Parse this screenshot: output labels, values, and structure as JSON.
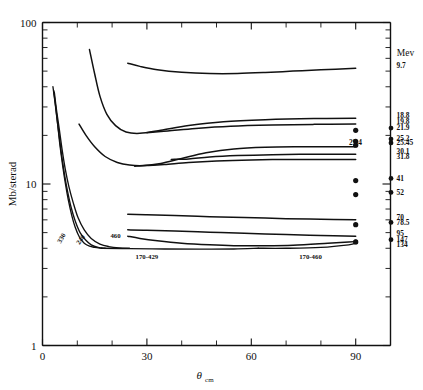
{
  "figure": {
    "name": "differential-cross-section-vs-angle",
    "background": "#ffffff",
    "ink_color": "#111111"
  },
  "chart_data": {
    "type": "line",
    "title": "",
    "xlabel": "θ",
    "xlabel_sub": "cm",
    "ylabel": "Mb/sterad",
    "legend_title": "Mev",
    "legend_position": "right-outside",
    "grid": false,
    "xlim": [
      0,
      100
    ],
    "ylim": [
      1,
      100
    ],
    "yscale": "log",
    "xscale": "linear",
    "x_ticks_major": [
      0,
      30,
      60,
      90
    ],
    "x_tick_labels": [
      "0",
      "30",
      "60",
      "90"
    ],
    "x_ticks_minor": [
      10,
      20,
      40,
      50,
      70,
      80,
      100
    ],
    "y_ticks_major": [
      1,
      10,
      100
    ],
    "y_tick_labels": [
      "1",
      "10",
      "100"
    ],
    "y_ticks_minor": [
      2,
      3,
      4,
      5,
      6,
      7,
      8,
      9,
      20,
      30,
      40,
      50,
      60,
      70,
      80,
      90
    ],
    "series": [
      {
        "name": "9.7",
        "legend_label": "9.7",
        "kind": "curve",
        "end_y": 52,
        "points": [
          [
            24.5,
            56.0
          ],
          [
            28.0,
            53.5
          ],
          [
            33.0,
            51.0
          ],
          [
            40.0,
            49.2
          ],
          [
            48.0,
            48.3
          ],
          [
            56.0,
            48.3
          ],
          [
            64.0,
            49.0
          ],
          [
            72.0,
            50.0
          ],
          [
            80.0,
            51.0
          ],
          [
            90.0,
            52.0
          ]
        ]
      },
      {
        "name": "18.8",
        "legend_label": "18.8",
        "kind": "curve",
        "end_y": 25.5,
        "points": [
          [
            13.5,
            68.0
          ],
          [
            15.0,
            48.0
          ],
          [
            16.5,
            35.0
          ],
          [
            18.5,
            27.0
          ],
          [
            21.0,
            23.0
          ],
          [
            24.0,
            21.0
          ],
          [
            28.0,
            20.6
          ],
          [
            34.0,
            21.5
          ],
          [
            42.0,
            23.0
          ],
          [
            52.0,
            24.3
          ],
          [
            64.0,
            25.0
          ],
          [
            78.0,
            25.4
          ],
          [
            90.0,
            25.5
          ]
        ]
      },
      {
        "name": "19.8",
        "legend_label": "19.8",
        "kind": "curve",
        "end_y": 23.5,
        "points": [
          [
            30.0,
            20.8
          ],
          [
            36.0,
            21.3
          ],
          [
            44.0,
            22.1
          ],
          [
            54.0,
            22.8
          ],
          [
            66.0,
            23.2
          ],
          [
            78.0,
            23.4
          ],
          [
            90.0,
            23.5
          ]
        ]
      },
      {
        "name": "21.9",
        "legend_label": "21.9",
        "kind": "point",
        "point": [
          90.0,
          21.5
        ]
      },
      {
        "name": "25.2",
        "legend_label": "25.2",
        "kind": "point",
        "point": [
          90.0,
          18.4
        ]
      },
      {
        "name": "25.45",
        "legend_label": "25.45",
        "kind": "point",
        "point": [
          90.0,
          17.4
        ]
      },
      {
        "name": "29.4",
        "legend_label": "29.4",
        "kind": "curve",
        "end_y": 17.0,
        "points": [
          [
            10.5,
            23.5
          ],
          [
            12.5,
            20.0
          ],
          [
            15.0,
            17.0
          ],
          [
            18.0,
            14.8
          ],
          [
            21.5,
            13.6
          ],
          [
            25.0,
            13.1
          ],
          [
            29.0,
            13.0
          ],
          [
            34.0,
            13.4
          ],
          [
            40.0,
            14.4
          ],
          [
            47.0,
            15.6
          ],
          [
            55.0,
            16.5
          ],
          [
            64.0,
            16.9
          ],
          [
            74.0,
            17.0
          ],
          [
            84.0,
            17.0
          ],
          [
            90.0,
            17.0
          ]
        ]
      },
      {
        "name": "30.1",
        "legend_label": "30.1",
        "kind": "curve",
        "end_y": 15.3,
        "points": [
          [
            37.0,
            14.2
          ],
          [
            42.0,
            14.3
          ],
          [
            48.0,
            14.7
          ],
          [
            56.0,
            15.0
          ],
          [
            66.0,
            15.2
          ],
          [
            78.0,
            15.3
          ],
          [
            90.0,
            15.3
          ]
        ]
      },
      {
        "name": "31.8",
        "legend_label": "31.8",
        "kind": "curve",
        "end_y": 14.2,
        "points": [
          [
            26.5,
            12.9
          ],
          [
            30.0,
            13.0
          ],
          [
            35.0,
            13.2
          ],
          [
            42.0,
            13.6
          ],
          [
            50.0,
            13.9
          ],
          [
            60.0,
            14.1
          ],
          [
            72.0,
            14.2
          ],
          [
            82.0,
            14.2
          ],
          [
            90.0,
            14.2
          ]
        ]
      },
      {
        "name": "41",
        "legend_label": "41",
        "kind": "point",
        "point": [
          90.0,
          10.5
        ]
      },
      {
        "name": "52",
        "legend_label": "52",
        "kind": "point",
        "point": [
          90.0,
          8.6
        ]
      },
      {
        "name": "70",
        "legend_label": "70",
        "kind": "curve",
        "end_y": 6.0,
        "points": [
          [
            24.5,
            6.5
          ],
          [
            30.0,
            6.45
          ],
          [
            38.0,
            6.38
          ],
          [
            48.0,
            6.28
          ],
          [
            58.0,
            6.2
          ],
          [
            70.0,
            6.1
          ],
          [
            80.0,
            6.05
          ],
          [
            90.0,
            6.0
          ]
        ]
      },
      {
        "name": "78.5",
        "legend_label": "78.5",
        "kind": "point",
        "point": [
          90.0,
          5.6
        ]
      },
      {
        "name": "95",
        "legend_label": "95",
        "kind": "curve",
        "end_y": 4.75,
        "points": [
          [
            24.5,
            5.2
          ],
          [
            30.0,
            5.18
          ],
          [
            38.0,
            5.12
          ],
          [
            48.0,
            5.03
          ],
          [
            58.0,
            4.95
          ],
          [
            70.0,
            4.87
          ],
          [
            80.0,
            4.8
          ],
          [
            90.0,
            4.75
          ]
        ]
      },
      {
        "name": "147",
        "legend_label": "147",
        "kind": "point",
        "point": [
          90.0,
          4.38
        ]
      },
      {
        "name": "134",
        "legend_label": "134",
        "kind": "curve_to_point",
        "end_y": 4.2,
        "points": [
          [
            24.5,
            4.75
          ],
          [
            28.0,
            4.6
          ],
          [
            33.0,
            4.45
          ],
          [
            40.0,
            4.3
          ],
          [
            48.0,
            4.2
          ],
          [
            55.0,
            4.15
          ],
          [
            62.0,
            4.15
          ],
          [
            72.0,
            4.18
          ],
          [
            82.0,
            4.3
          ],
          [
            88.0,
            4.38
          ],
          [
            90.0,
            4.4
          ]
        ]
      },
      {
        "name": "330",
        "legend_label": "330",
        "kind": "steep",
        "inline_label": "330",
        "points": [
          [
            3.2,
            38.0
          ],
          [
            3.8,
            30.0
          ],
          [
            4.4,
            23.0
          ],
          [
            5.0,
            17.5
          ],
          [
            5.8,
            13.0
          ],
          [
            6.6,
            10.0
          ],
          [
            7.4,
            8.0
          ],
          [
            8.4,
            6.4
          ],
          [
            9.4,
            5.4
          ],
          [
            10.6,
            4.7
          ],
          [
            12.0,
            4.3
          ],
          [
            13.5,
            4.12
          ],
          [
            15.0,
            4.05
          ],
          [
            17.0,
            4.0
          ]
        ]
      },
      {
        "name": "240",
        "legend_label": "240",
        "kind": "steep",
        "inline_label": "240",
        "points": [
          [
            3.0,
            40.0
          ],
          [
            3.6,
            32.0
          ],
          [
            4.2,
            25.0
          ],
          [
            4.9,
            19.0
          ],
          [
            5.6,
            14.5
          ],
          [
            6.4,
            11.2
          ],
          [
            7.2,
            9.0
          ],
          [
            8.2,
            7.2
          ],
          [
            9.4,
            5.9
          ],
          [
            10.8,
            5.0
          ],
          [
            12.4,
            4.5
          ],
          [
            14.0,
            4.2
          ],
          [
            16.0,
            4.05
          ],
          [
            18.0,
            4.0
          ]
        ]
      },
      {
        "name": "460",
        "legend_label": "460",
        "kind": "steep",
        "inline_label": "460",
        "points": [
          [
            3.4,
            37.0
          ],
          [
            4.0,
            29.0
          ],
          [
            4.8,
            22.0
          ],
          [
            5.6,
            16.5
          ],
          [
            6.5,
            12.5
          ],
          [
            7.6,
            9.6
          ],
          [
            8.8,
            7.7
          ],
          [
            10.2,
            6.2
          ],
          [
            12.0,
            5.2
          ],
          [
            14.0,
            4.6
          ],
          [
            16.5,
            4.25
          ],
          [
            19.0,
            4.1
          ],
          [
            22.0,
            4.02
          ],
          [
            25.0,
            4.0
          ]
        ]
      },
      {
        "name": "170-429",
        "legend_label": "170-429",
        "kind": "baseline",
        "inline_label": "170-429",
        "points": [
          [
            17.0,
            4.0
          ],
          [
            25.0,
            3.98
          ],
          [
            35.0,
            3.96
          ],
          [
            45.0,
            3.95
          ],
          [
            55.0,
            3.96
          ],
          [
            62.0,
            4.0
          ]
        ]
      },
      {
        "name": "170-460",
        "legend_label": "170-460",
        "kind": "baseline",
        "inline_label": "170-460",
        "points": [
          [
            62.0,
            4.0
          ],
          [
            70.0,
            4.0
          ],
          [
            80.0,
            4.05
          ],
          [
            88.0,
            4.2
          ],
          [
            90.0,
            4.3
          ]
        ]
      }
    ],
    "inline_annotations": [
      {
        "label": "330",
        "x": 6.0,
        "y": 4.55,
        "rotation": -60
      },
      {
        "label": "240",
        "x": 11.5,
        "y": 4.45,
        "rotation": -55
      },
      {
        "label": "460",
        "x": 21.0,
        "y": 4.6,
        "rotation": 0
      },
      {
        "label": "170-429",
        "x": 30.0,
        "y": 3.45,
        "rotation": 0
      },
      {
        "label": "170-460",
        "x": 77.0,
        "y": 3.45,
        "rotation": 0
      }
    ],
    "legend_entries": [
      {
        "label": "9.7",
        "y": 52.0,
        "marker": false
      },
      {
        "label": "18.8",
        "y": 25.5,
        "marker": false
      },
      {
        "label": "19.8",
        "y": 23.5,
        "marker": false
      },
      {
        "label": "21.9",
        "y": 21.5,
        "marker": true
      },
      {
        "label": "25.2",
        "y": 18.4,
        "marker": true
      },
      {
        "label": "25.45",
        "y": 17.4,
        "marker": true
      },
      {
        "label": "30.1",
        "y": 15.3,
        "marker": false
      },
      {
        "label": "31.8",
        "y": 14.2,
        "marker": false
      },
      {
        "label": "41",
        "y": 10.5,
        "marker": true
      },
      {
        "label": "52",
        "y": 8.6,
        "marker": true
      },
      {
        "label": "70",
        "y": 6.0,
        "marker": false
      },
      {
        "label": "78.5",
        "y": 5.6,
        "marker": true
      },
      {
        "label": "95",
        "y": 4.75,
        "marker": false
      },
      {
        "label": "147",
        "y": 4.38,
        "marker": true
      },
      {
        "label": "134",
        "y": 4.1,
        "marker": false
      }
    ],
    "side_annotation": {
      "label": "29.4",
      "y": 17.4
    }
  }
}
